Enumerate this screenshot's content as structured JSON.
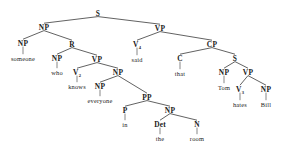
{
  "diagram": {
    "type": "constituency-tree",
    "sentence": "someone who knows everyone in the room said that Tom hates Bill",
    "ink_color": "#1a1a1a",
    "edge_color": "#3a3a3a",
    "background": "#ffffff",
    "nodes": [
      {
        "id": "s-root",
        "label": "S",
        "sub": "",
        "kind": "category",
        "x": 98,
        "y": 13
      },
      {
        "id": "np-subj",
        "label": "NP",
        "sub": "",
        "kind": "category",
        "x": 44,
        "y": 27
      },
      {
        "id": "vp-matrix",
        "label": "VP",
        "sub": "",
        "kind": "category",
        "x": 160,
        "y": 28
      },
      {
        "id": "np-someone",
        "label": "NP",
        "sub": "",
        "kind": "category",
        "x": 23,
        "y": 43
      },
      {
        "id": "r-rel",
        "label": "R",
        "sub": "",
        "kind": "category",
        "x": 72,
        "y": 44
      },
      {
        "id": "v-said",
        "label": "V",
        "sub": "4",
        "kind": "category",
        "x": 137,
        "y": 44
      },
      {
        "id": "cp",
        "label": "CP",
        "sub": "",
        "kind": "category",
        "x": 212,
        "y": 44
      },
      {
        "id": "w-someone",
        "label": "someone",
        "sub": "",
        "kind": "word",
        "x": 23,
        "y": 58
      },
      {
        "id": "np-who",
        "label": "NP",
        "sub": "",
        "kind": "category",
        "x": 57,
        "y": 58
      },
      {
        "id": "vp-rel",
        "label": "VP",
        "sub": "",
        "kind": "category",
        "x": 97,
        "y": 59
      },
      {
        "id": "w-said",
        "label": "said",
        "sub": "",
        "kind": "word",
        "x": 137,
        "y": 59
      },
      {
        "id": "c-that",
        "label": "C",
        "sub": "",
        "kind": "category",
        "x": 180,
        "y": 58
      },
      {
        "id": "s-embedded",
        "label": "S",
        "sub": "",
        "kind": "category",
        "x": 235,
        "y": 58
      },
      {
        "id": "w-who",
        "label": "who",
        "sub": "",
        "kind": "word",
        "x": 57,
        "y": 72
      },
      {
        "id": "v-knows",
        "label": "V",
        "sub": "2",
        "kind": "category",
        "x": 77,
        "y": 72
      },
      {
        "id": "np-obj",
        "label": "NP",
        "sub": "",
        "kind": "category",
        "x": 118,
        "y": 72
      },
      {
        "id": "w-that",
        "label": "that",
        "sub": "",
        "kind": "word",
        "x": 180,
        "y": 73
      },
      {
        "id": "np-tom",
        "label": "NP",
        "sub": "",
        "kind": "category",
        "x": 224,
        "y": 72
      },
      {
        "id": "vp-embedded",
        "label": "VP",
        "sub": "",
        "kind": "category",
        "x": 248,
        "y": 72
      },
      {
        "id": "w-knows",
        "label": "knows",
        "sub": "",
        "kind": "word",
        "x": 77,
        "y": 86
      },
      {
        "id": "np-everyone",
        "label": "NP",
        "sub": "",
        "kind": "category",
        "x": 100,
        "y": 86
      },
      {
        "id": "pp",
        "label": "PP",
        "sub": "",
        "kind": "category",
        "x": 147,
        "y": 97
      },
      {
        "id": "w-tom",
        "label": "Tom",
        "sub": "",
        "kind": "word",
        "x": 224,
        "y": 87
      },
      {
        "id": "v-hates",
        "label": "V",
        "sub": "3",
        "kind": "category",
        "x": 240,
        "y": 89
      },
      {
        "id": "np-bill",
        "label": "NP",
        "sub": "",
        "kind": "category",
        "x": 266,
        "y": 89
      },
      {
        "id": "w-everyone",
        "label": "everyone",
        "sub": "",
        "kind": "word",
        "x": 100,
        "y": 100
      },
      {
        "id": "p-in",
        "label": "P",
        "sub": "",
        "kind": "category",
        "x": 125,
        "y": 110
      },
      {
        "id": "np-room",
        "label": "NP",
        "sub": "",
        "kind": "category",
        "x": 170,
        "y": 110
      },
      {
        "id": "w-hates",
        "label": "hates",
        "sub": "",
        "kind": "word",
        "x": 240,
        "y": 104
      },
      {
        "id": "w-bill",
        "label": "Bill",
        "sub": "",
        "kind": "word",
        "x": 266,
        "y": 104
      },
      {
        "id": "w-in",
        "label": "in",
        "sub": "",
        "kind": "word",
        "x": 125,
        "y": 124
      },
      {
        "id": "det-the",
        "label": "Det",
        "sub": "",
        "kind": "category",
        "x": 160,
        "y": 124
      },
      {
        "id": "n-room",
        "label": "N",
        "sub": "",
        "kind": "category",
        "x": 197,
        "y": 124
      },
      {
        "id": "w-the",
        "label": "the",
        "sub": "",
        "kind": "word",
        "x": 160,
        "y": 138
      },
      {
        "id": "w-room",
        "label": "room",
        "sub": "",
        "kind": "word",
        "x": 197,
        "y": 138
      }
    ],
    "edges": [
      {
        "from": "s-root",
        "to": "np-subj",
        "style": "branch"
      },
      {
        "from": "s-root",
        "to": "vp-matrix",
        "style": "branch"
      },
      {
        "from": "np-subj",
        "to": "np-someone",
        "style": "branch"
      },
      {
        "from": "np-subj",
        "to": "r-rel",
        "style": "branch"
      },
      {
        "from": "np-someone",
        "to": "w-someone",
        "style": "stem"
      },
      {
        "from": "r-rel",
        "to": "np-who",
        "style": "branch"
      },
      {
        "from": "r-rel",
        "to": "vp-rel",
        "style": "branch"
      },
      {
        "from": "np-who",
        "to": "w-who",
        "style": "stem"
      },
      {
        "from": "vp-rel",
        "to": "v-knows",
        "style": "branch"
      },
      {
        "from": "vp-rel",
        "to": "np-obj",
        "style": "branch"
      },
      {
        "from": "v-knows",
        "to": "w-knows",
        "style": "stem"
      },
      {
        "from": "np-obj",
        "to": "np-everyone",
        "style": "branch"
      },
      {
        "from": "np-obj",
        "to": "pp",
        "style": "branch"
      },
      {
        "from": "np-everyone",
        "to": "w-everyone",
        "style": "stem"
      },
      {
        "from": "pp",
        "to": "p-in",
        "style": "branch"
      },
      {
        "from": "pp",
        "to": "np-room",
        "style": "branch"
      },
      {
        "from": "p-in",
        "to": "w-in",
        "style": "stem"
      },
      {
        "from": "np-room",
        "to": "det-the",
        "style": "branch"
      },
      {
        "from": "np-room",
        "to": "n-room",
        "style": "branch"
      },
      {
        "from": "det-the",
        "to": "w-the",
        "style": "stem"
      },
      {
        "from": "n-room",
        "to": "w-room",
        "style": "stem"
      },
      {
        "from": "vp-matrix",
        "to": "v-said",
        "style": "branch"
      },
      {
        "from": "vp-matrix",
        "to": "cp",
        "style": "branch"
      },
      {
        "from": "v-said",
        "to": "w-said",
        "style": "stem"
      },
      {
        "from": "cp",
        "to": "c-that",
        "style": "branch"
      },
      {
        "from": "cp",
        "to": "s-embedded",
        "style": "branch"
      },
      {
        "from": "c-that",
        "to": "w-that",
        "style": "stem"
      },
      {
        "from": "s-embedded",
        "to": "np-tom",
        "style": "branch"
      },
      {
        "from": "s-embedded",
        "to": "vp-embedded",
        "style": "branch"
      },
      {
        "from": "np-tom",
        "to": "w-tom",
        "style": "stem"
      },
      {
        "from": "vp-embedded",
        "to": "v-hates",
        "style": "branch"
      },
      {
        "from": "vp-embedded",
        "to": "np-bill",
        "style": "branch"
      },
      {
        "from": "v-hates",
        "to": "w-hates",
        "style": "stem"
      },
      {
        "from": "np-bill",
        "to": "w-bill",
        "style": "stem"
      }
    ]
  }
}
